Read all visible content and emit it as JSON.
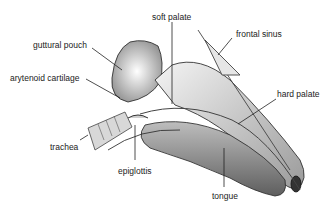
{
  "diagram": {
    "labels": {
      "soft_palate": "soft palate",
      "frontal_sinus": "frontal sinus",
      "guttural_pouch": "guttural pouch",
      "arytenoid_cartilage": "arytenoid cartilage",
      "hard_palate": "hard palate",
      "trachea": "trachea",
      "epiglottis": "epiglottis",
      "tongue": "tongue"
    }
  }
}
